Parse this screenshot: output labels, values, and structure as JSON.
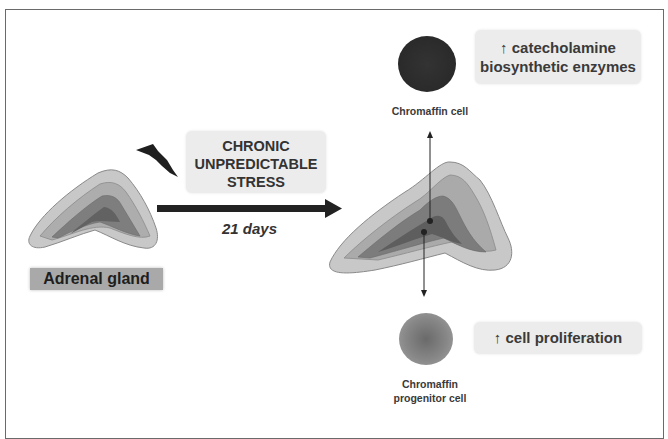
{
  "diagram": {
    "stress_box": {
      "lines": [
        "CHRONIC",
        "UNPREDICTABLE",
        "STRESS"
      ]
    },
    "duration_label": "21 days",
    "gland_label": "Adrenal gland",
    "chromaffin_cell": {
      "label": "Chromaffin cell"
    },
    "progenitor_cell": {
      "label_lines": [
        "Chromaffin",
        "progenitor cell"
      ]
    },
    "enzyme_effect": {
      "lines": [
        "↑ catecholamine",
        "biosynthetic enzymes"
      ]
    },
    "proliferation_effect": {
      "label": "↑  cell proliferation"
    },
    "icons": {
      "stress": "lightning-bolt",
      "transition": "right-arrow",
      "up_pointer": "arrow-up-line",
      "down_pointer": "arrow-down-line"
    },
    "colors": {
      "gland_outer": "#c4c4c4",
      "gland_middle": "#a8a8a8",
      "gland_inner": "#7a7a7a",
      "gland_core": "#606060",
      "label_box": "#ececec",
      "gland_label_bg": "#a9a9a9",
      "arrow": "#222222"
    }
  }
}
